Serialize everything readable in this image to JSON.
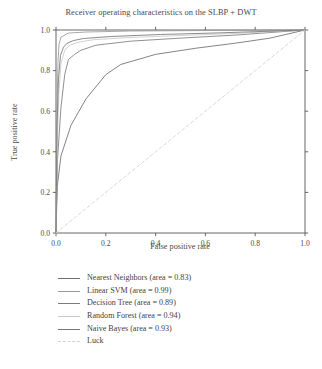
{
  "figure": {
    "title": "Receiver operating characteristics on the SLBP + DWT",
    "caption_fragment": ""
  },
  "axes": {
    "xlabel": "False positive rate",
    "ylabel": "True positive rate",
    "xticks": [
      "0.0",
      "0.2",
      "0.4",
      "0.6",
      "0.8",
      "1.0"
    ],
    "yticks": [
      "0.0",
      "0.2",
      "0.4",
      "0.6",
      "0.8",
      "1.0"
    ]
  },
  "legend": {
    "items": [
      {
        "label": "Nearest Neighbors (area = 0.83)",
        "color": "#6e6e6e",
        "dash": "none"
      },
      {
        "label": "Linear SVM (area = 0.99)",
        "color": "#9a9a9a",
        "dash": "none"
      },
      {
        "label": "Decision Tree (area = 0.89)",
        "color": "#7c7c7c",
        "dash": "none"
      },
      {
        "label": "Random Forest (area = 0.94)",
        "color": "#c9c9c9",
        "dash": "none"
      },
      {
        "label": "Naive Bayes (area = 0.93)",
        "color": "#767676",
        "dash": "none"
      },
      {
        "label": "Luck",
        "color": "#d2d2d2",
        "dash": "dashed"
      }
    ]
  },
  "chart_data": {
    "type": "line",
    "title": "Receiver operating characteristics on the SLBP + DWT",
    "xlabel": "False positive rate",
    "ylabel": "True positive rate",
    "xlim": [
      0.0,
      1.0
    ],
    "ylim": [
      0.0,
      1.0
    ],
    "grid": false,
    "legend_position": "below-plot",
    "series": [
      {
        "name": "Nearest Neighbors",
        "area": 0.83,
        "color": "#6e6e6e",
        "dash": "none",
        "x": [
          0.0,
          0.005,
          0.02,
          0.06,
          0.12,
          0.2,
          0.26,
          0.4,
          0.56,
          0.72,
          0.86,
          1.0
        ],
        "y": [
          0.0,
          0.23,
          0.38,
          0.53,
          0.66,
          0.78,
          0.83,
          0.88,
          0.91,
          0.935,
          0.96,
          1.0
        ]
      },
      {
        "name": "Linear SVM",
        "area": 0.99,
        "color": "#9a9a9a",
        "dash": "none",
        "x": [
          0.0,
          0.004,
          0.008,
          0.012,
          0.02,
          0.05,
          0.12,
          0.3,
          0.55,
          0.8,
          1.0
        ],
        "y": [
          0.0,
          0.62,
          0.84,
          0.93,
          0.965,
          0.985,
          0.99,
          0.995,
          0.997,
          0.999,
          1.0
        ]
      },
      {
        "name": "Decision Tree",
        "area": 0.89,
        "color": "#7c7c7c",
        "dash": "none",
        "x": [
          0.0,
          0.006,
          0.02,
          0.035,
          0.05,
          0.075,
          0.1,
          0.16,
          0.3,
          0.5,
          0.72,
          1.0
        ],
        "y": [
          0.0,
          0.36,
          0.62,
          0.78,
          0.855,
          0.88,
          0.9,
          0.925,
          0.945,
          0.96,
          0.975,
          1.0
        ]
      },
      {
        "name": "Random Forest",
        "area": 0.94,
        "color": "#c9c9c9",
        "dash": "none",
        "x": [
          0.0,
          0.005,
          0.012,
          0.02,
          0.035,
          0.055,
          0.09,
          0.15,
          0.28,
          0.48,
          0.7,
          1.0
        ],
        "y": [
          0.0,
          0.45,
          0.7,
          0.835,
          0.9,
          0.925,
          0.94,
          0.952,
          0.962,
          0.972,
          0.982,
          1.0
        ]
      },
      {
        "name": "Naive Bayes",
        "area": 0.93,
        "color": "#767676",
        "dash": "none",
        "x": [
          0.0,
          0.004,
          0.01,
          0.018,
          0.03,
          0.045,
          0.07,
          0.11,
          0.22,
          0.42,
          0.66,
          1.0
        ],
        "y": [
          0.0,
          0.52,
          0.76,
          0.875,
          0.915,
          0.935,
          0.948,
          0.958,
          0.968,
          0.978,
          0.986,
          1.0
        ]
      },
      {
        "name": "Luck",
        "color": "#d2d2d2",
        "dash": "dashed",
        "x": [
          0.0,
          1.0
        ],
        "y": [
          0.0,
          1.0
        ]
      }
    ]
  }
}
